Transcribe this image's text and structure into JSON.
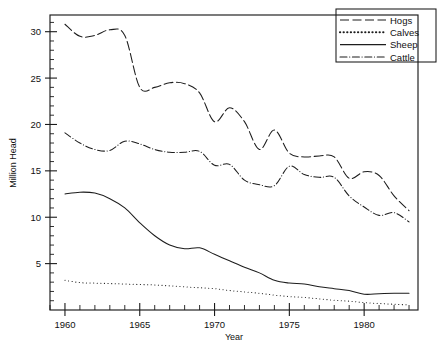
{
  "chart_data": {
    "type": "line",
    "title": "",
    "xlabel": "Year",
    "ylabel": "Million Head",
    "xlim": [
      1959,
      1983.6
    ],
    "ylim": [
      0,
      31.8
    ],
    "grid": false,
    "legend_position": "top-right",
    "x_ticks": [
      1960,
      1965,
      1970,
      1975,
      1980
    ],
    "x_tick_labels": [
      "1960",
      "1965",
      "1970",
      "1975",
      "1980"
    ],
    "x_minor_step": 1,
    "y_ticks": [
      5,
      10,
      15,
      20,
      25,
      30
    ],
    "y_tick_labels": [
      "5",
      "10",
      "15",
      "20",
      "25",
      "30"
    ],
    "y_minor_step": 1,
    "x": [
      1960,
      1961,
      1962,
      1963,
      1964,
      1965,
      1966,
      1967,
      1968,
      1969,
      1970,
      1971,
      1972,
      1973,
      1974,
      1975,
      1976,
      1977,
      1978,
      1979,
      1980,
      1981,
      1982,
      1983
    ],
    "series": [
      {
        "name": "Hogs",
        "style": "dashed",
        "values": [
          30.8,
          29.5,
          29.6,
          30.2,
          29.6,
          24.0,
          24.0,
          24.5,
          24.4,
          23.4,
          20.3,
          21.8,
          20.3,
          17.3,
          19.4,
          16.9,
          16.5,
          16.6,
          16.5,
          14.2,
          14.9,
          14.5,
          12.3,
          10.7
        ]
      },
      {
        "name": "Calves",
        "style": "dotted",
        "values": [
          3.2,
          2.95,
          2.9,
          2.85,
          2.8,
          2.75,
          2.7,
          2.6,
          2.5,
          2.4,
          2.3,
          2.1,
          1.95,
          1.8,
          1.6,
          1.45,
          1.35,
          1.2,
          1.05,
          0.95,
          0.8,
          0.7,
          0.62,
          0.55
        ]
      },
      {
        "name": "Sheep",
        "style": "solid",
        "values": [
          12.5,
          12.7,
          12.6,
          12.0,
          11.0,
          9.4,
          8.0,
          7.0,
          6.6,
          6.7,
          6.0,
          5.3,
          4.6,
          4.0,
          3.2,
          2.9,
          2.8,
          2.5,
          2.3,
          2.1,
          1.7,
          1.75,
          1.8,
          1.8
        ]
      },
      {
        "name": "Cattle",
        "style": "dashdot",
        "values": [
          19.1,
          18.0,
          17.3,
          17.2,
          18.2,
          17.9,
          17.3,
          17.0,
          17.0,
          17.1,
          15.6,
          15.7,
          14.0,
          13.5,
          13.4,
          15.5,
          14.6,
          14.3,
          14.3,
          12.3,
          11.1,
          10.2,
          10.5,
          9.5
        ]
      }
    ]
  },
  "legend": {
    "entries": [
      {
        "label": "Hogs"
      },
      {
        "label": "Calves"
      },
      {
        "label": "Sheep"
      },
      {
        "label": "Cattle"
      }
    ]
  }
}
